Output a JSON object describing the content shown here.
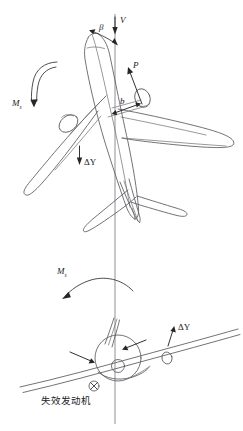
{
  "figure": {
    "background_color": "#ffffff",
    "line_color": "#5a5a5e",
    "label_color": "#1b1b1d",
    "width": 243,
    "height": 431
  },
  "labels": {
    "velocity": "V",
    "sideslip_angle": "β",
    "thrust": "P",
    "moment_arm": "b",
    "yaw_moment_top": "M",
    "yaw_moment_top_sub": "s",
    "lift_change_top": "ΔY",
    "roll_moment_bottom": "M",
    "roll_moment_bottom_sub": "s",
    "lift_change_bottom": "ΔY",
    "failed_engine": "失效发动机"
  },
  "views": {
    "top": {
      "name": "top-view-aircraft",
      "description": "Planform view of airliner yawed relative to the vertical flight-path axis"
    },
    "front": {
      "name": "front-view-aircraft",
      "description": "Front view of airliner banked about the flight-path axis"
    }
  },
  "annotations": {
    "flight_path_axis": "vertical reference line",
    "failed_engine_marker": "crossed-circle on left wing"
  }
}
